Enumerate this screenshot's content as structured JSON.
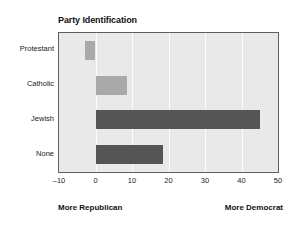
{
  "chart_data": {
    "type": "bar",
    "orientation": "horizontal",
    "title": "Party Identification",
    "categories": [
      "Protestant",
      "Catholic",
      "Jewish",
      "None"
    ],
    "values": [
      -3,
      8.5,
      45,
      18.5
    ],
    "bar_colors": [
      "#a9a9a9",
      "#a9a9a9",
      "#555555",
      "#555555"
    ],
    "xlabel": "",
    "ylabel": "",
    "xlim": [
      -10,
      50
    ],
    "xticks": [
      -10,
      0,
      10,
      20,
      30,
      40,
      50
    ],
    "xtick_labels": [
      "–10",
      "0",
      "10",
      "20",
      "30",
      "40",
      "50"
    ],
    "grid": true,
    "grid_axis": "x",
    "grid_color": "#ffffff",
    "plot_background": "#e9e9e9",
    "legend": false,
    "annotations": [
      {
        "text": "More Republican",
        "position": "bottom-left"
      },
      {
        "text": "More Democrat",
        "position": "bottom-right"
      }
    ]
  },
  "footer": {
    "left_label": "More Republican",
    "right_label": "More Democrat"
  }
}
